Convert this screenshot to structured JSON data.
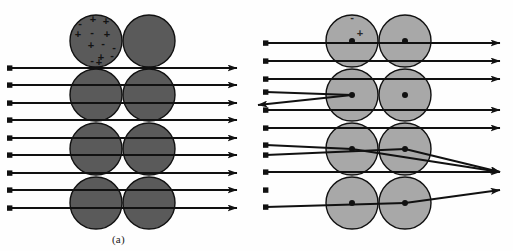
{
  "figure": {
    "background_color": "#fefefe",
    "width": 513,
    "height": 251
  },
  "panels": [
    {
      "id": "a",
      "caption": "(a)",
      "model_name": "Thomson plum-pudding model",
      "atom_fill": "#5a5a5a",
      "atom_stroke": "#111111",
      "atom_radius": 26,
      "columns_x": [
        96,
        149
      ],
      "rows_y": [
        41,
        95,
        149,
        203
      ],
      "charge_symbols": [
        {
          "sign": "-",
          "x": 80,
          "y": 27
        },
        {
          "sign": "+",
          "x": 93,
          "y": 23
        },
        {
          "sign": "+",
          "x": 106,
          "y": 25
        },
        {
          "sign": "+",
          "x": 78,
          "y": 38
        },
        {
          "sign": "-",
          "x": 92,
          "y": 36
        },
        {
          "sign": "+",
          "x": 107,
          "y": 38
        },
        {
          "sign": "+",
          "x": 91,
          "y": 49
        },
        {
          "sign": "-",
          "x": 103,
          "y": 47
        },
        {
          "sign": "-",
          "x": 114,
          "y": 51
        },
        {
          "sign": "+",
          "x": 101,
          "y": 61
        },
        {
          "sign": "-",
          "x": 112,
          "y": 59
        },
        {
          "sign": "-",
          "x": 92,
          "y": 64
        },
        {
          "sign": "+",
          "x": 99,
          "y": 66
        }
      ],
      "beam_start_x": 10,
      "beam_end_x": 237,
      "beam_rows_y": [
        68,
        85,
        103,
        120,
        138,
        155,
        173,
        190,
        208
      ],
      "deflected_count": 0,
      "description": "All incident rays pass straight through undeflected."
    },
    {
      "id": "b",
      "caption": "(b)",
      "model_name": "Rutherford nuclear model",
      "atom_fill": "#a8a8a8",
      "atom_stroke": "#111111",
      "atom_radius": 26,
      "nucleus_fill": "#111111",
      "nucleus_radius": 3,
      "columns_x": [
        352,
        405
      ],
      "rows_y": [
        41,
        95,
        149,
        203
      ],
      "charge_symbols": [
        {
          "sign": "-",
          "x": 352,
          "y": 21
        },
        {
          "sign": "+",
          "x": 360,
          "y": 37
        }
      ],
      "beam_start_x": 266,
      "beam_end_x": 500,
      "beam_rows_y": [
        43,
        61,
        79,
        92,
        110,
        128,
        145,
        155,
        172,
        190,
        207
      ],
      "straight_rows_y": [
        43,
        61,
        79,
        110,
        128,
        172
      ],
      "deflections": [
        {
          "name": "backscatter",
          "entry_y": 92,
          "nucleus_x": 352,
          "nucleus_y": 95,
          "exit_x": 258,
          "exit_y": 105
        },
        {
          "name": "forward-down",
          "entry_y": 145,
          "nucleus_x": 352,
          "nucleus_y": 149,
          "exit_x": 500,
          "exit_y": 172
        },
        {
          "name": "forward-down-2",
          "entry_y": 155,
          "nucleus_x": 405,
          "nucleus_y": 149,
          "exit_x": 500,
          "exit_y": 172
        },
        {
          "name": "forward-up",
          "entry_y": 207,
          "nucleus_x": 405,
          "nucleus_y": 203,
          "exit_x": 500,
          "exit_y": 190
        }
      ],
      "description": "Most rays pass straight through; a few are strongly deflected or backscattered by the nucleus."
    }
  ],
  "legend": {
    "minus_sign": "-",
    "plus_sign": "+"
  }
}
